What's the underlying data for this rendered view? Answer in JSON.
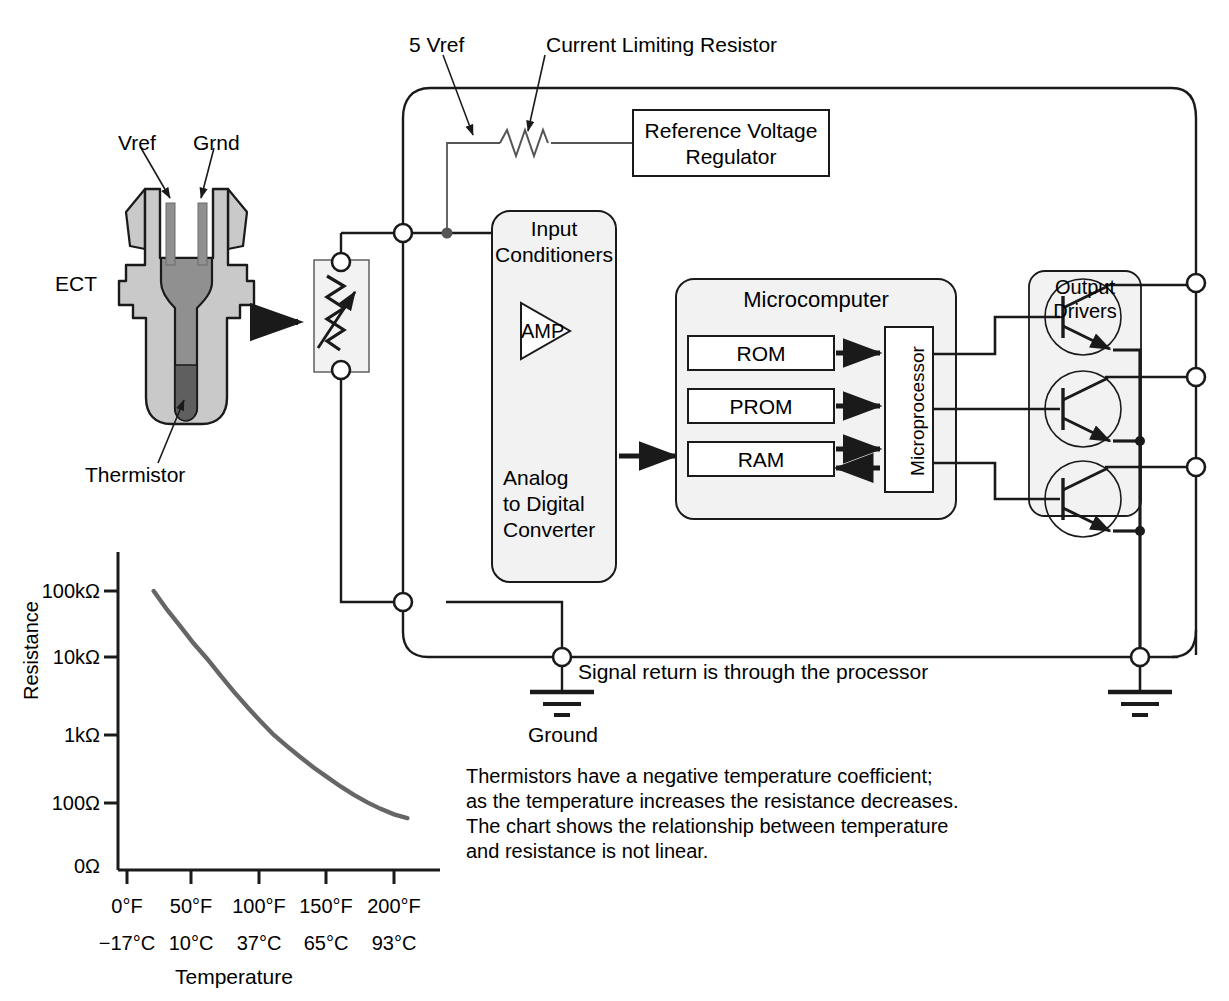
{
  "diagram": {
    "sensor": {
      "name_label": "ECT",
      "pin_vref_label": "Vref",
      "pin_grnd_label": "Grnd",
      "thermistor_label": "Thermistor"
    },
    "wiring": {
      "vref_label": "5 Vref",
      "current_limiting_resistor_label": "Current Limiting Resistor",
      "ground_label": "Ground",
      "signal_return_note": "Signal return is through the processor"
    },
    "blocks": {
      "reference_voltage_regulator": "Reference Voltage\nRegulator",
      "reference_voltage_regulator_line1": "Reference Voltage",
      "reference_voltage_regulator_line2": "Regulator",
      "input_conditioners_line1": "Input",
      "input_conditioners_line2": "Conditioners",
      "amp_label": "AMP",
      "adc_line1": "Analog",
      "adc_line2": "to Digital",
      "adc_line3": "Converter",
      "microcomputer_label": "Microcomputer",
      "rom_label": "ROM",
      "prom_label": "PROM",
      "ram_label": "RAM",
      "microprocessor_label": "Microprocessor",
      "output_drivers_line1": "Output",
      "output_drivers_line2": "Drivers"
    },
    "note": {
      "line1": "Thermistors have a negative temperature coefficient;",
      "line2": "as the temperature increases the resistance decreases.",
      "line3": "The chart shows the relationship between temperature",
      "line4": "and resistance is not linear."
    },
    "colors": {
      "line": "#1a1a1a",
      "curve": "#666666",
      "block_fill": "#f2f2f2",
      "sensor_light": "#c9c9c9",
      "sensor_mid": "#909090",
      "sensor_dark": "#5f5f5f"
    }
  },
  "chart_data": {
    "type": "line",
    "title": "",
    "xlabel": "Temperature",
    "ylabel": "Resistance",
    "grid": false,
    "legend": null,
    "y_tick_labels": [
      "100kΩ",
      "10kΩ",
      "1kΩ",
      "100Ω",
      "0Ω"
    ],
    "y_tick_values": [
      100000,
      10000,
      1000,
      100,
      0
    ],
    "x_tick_labels_f": [
      "0°F",
      "50°F",
      "100°F",
      "150°F",
      "200°F"
    ],
    "x_tick_labels_c": [
      "−17°C",
      "10°C",
      "37°C",
      "65°C",
      "93°C"
    ],
    "x_tick_values_f": [
      0,
      50,
      100,
      150,
      200
    ],
    "x_tick_values_c": [
      -17,
      10,
      37,
      65,
      93
    ],
    "xlim": [
      -25,
      225
    ],
    "ylim_labels": [
      "0Ω",
      "100kΩ"
    ],
    "series": [
      {
        "name": "Thermistor resistance vs temperature",
        "x": [
          20,
          30,
          40,
          50,
          60,
          70,
          80,
          90,
          100,
          110,
          120,
          130,
          140,
          150,
          160,
          170,
          180,
          190,
          200,
          210
        ],
        "y": [
          100000,
          52000,
          29000,
          16000,
          9500,
          5800,
          3600,
          2300,
          1500,
          1000,
          680,
          470,
          330,
          240,
          175,
          132,
          102,
          82,
          68,
          60
        ],
        "y_units": "Ω"
      }
    ]
  }
}
